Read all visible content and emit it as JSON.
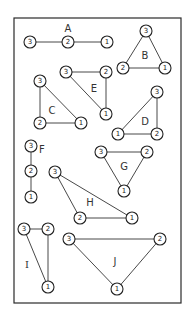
{
  "figure": {
    "frame": {
      "x": 14,
      "y": 18,
      "w": 167,
      "h": 285
    },
    "node_radius": 6,
    "graphs": [
      {
        "label": "A",
        "label_pos": [
          68,
          28
        ],
        "nodes": [
          {
            "id": "3",
            "x": 30,
            "y": 42
          },
          {
            "id": "2",
            "x": 68,
            "y": 42
          },
          {
            "id": "1",
            "x": 107,
            "y": 42
          }
        ],
        "edges": [
          [
            "3",
            "2"
          ],
          [
            "2",
            "1"
          ]
        ]
      },
      {
        "label": "B",
        "label_pos": [
          145,
          55
        ],
        "nodes": [
          {
            "id": "3",
            "x": 146,
            "y": 31
          },
          {
            "id": "2",
            "x": 123,
            "y": 68
          },
          {
            "id": "1",
            "x": 165,
            "y": 68
          }
        ],
        "edges": [
          [
            "3",
            "2"
          ],
          [
            "2",
            "1"
          ],
          [
            "3",
            "1"
          ]
        ]
      },
      {
        "label": "E",
        "label_pos": [
          94,
          88
        ],
        "nodes": [
          {
            "id": "3",
            "x": 66,
            "y": 72
          },
          {
            "id": "2",
            "x": 106,
            "y": 72
          },
          {
            "id": "1",
            "x": 106,
            "y": 114
          }
        ],
        "edges": [
          [
            "3",
            "2"
          ],
          [
            "2",
            "1"
          ],
          [
            "3",
            "1"
          ]
        ]
      },
      {
        "label": "C",
        "label_pos": [
          52,
          110
        ],
        "nodes": [
          {
            "id": "3",
            "x": 40,
            "y": 81
          },
          {
            "id": "2",
            "x": 40,
            "y": 123
          },
          {
            "id": "1",
            "x": 81,
            "y": 123
          }
        ],
        "edges": [
          [
            "3",
            "2"
          ],
          [
            "2",
            "1"
          ],
          [
            "3",
            "1"
          ]
        ]
      },
      {
        "label": "D",
        "label_pos": [
          145,
          121
        ],
        "nodes": [
          {
            "id": "3",
            "x": 157,
            "y": 92
          },
          {
            "id": "1",
            "x": 118,
            "y": 134
          },
          {
            "id": "2",
            "x": 157,
            "y": 134
          }
        ],
        "edges": [
          [
            "3",
            "2"
          ],
          [
            "1",
            "2"
          ],
          [
            "3",
            "1"
          ]
        ]
      },
      {
        "label": "F",
        "label_pos": [
          42,
          149
        ],
        "nodes": [
          {
            "id": "3",
            "x": 31,
            "y": 146
          },
          {
            "id": "2",
            "x": 31,
            "y": 171
          },
          {
            "id": "1",
            "x": 31,
            "y": 197
          }
        ],
        "edges": [
          [
            "3",
            "2"
          ],
          [
            "2",
            "1"
          ]
        ]
      },
      {
        "label": "G",
        "label_pos": [
          124,
          166
        ],
        "nodes": [
          {
            "id": "3",
            "x": 101,
            "y": 152
          },
          {
            "id": "2",
            "x": 147,
            "y": 152
          },
          {
            "id": "1",
            "x": 124,
            "y": 191
          }
        ],
        "edges": [
          [
            "3",
            "2"
          ],
          [
            "2",
            "1"
          ],
          [
            "3",
            "1"
          ]
        ]
      },
      {
        "label": "H",
        "label_pos": [
          90,
          202
        ],
        "nodes": [
          {
            "id": "3",
            "x": 55,
            "y": 172
          },
          {
            "id": "2",
            "x": 80,
            "y": 218
          },
          {
            "id": "1",
            "x": 132,
            "y": 218
          }
        ],
        "edges": [
          [
            "3",
            "2"
          ],
          [
            "2",
            "1"
          ],
          [
            "3",
            "1"
          ]
        ]
      },
      {
        "label": "I",
        "label_pos": [
          27,
          264
        ],
        "serif": true,
        "nodes": [
          {
            "id": "3",
            "x": 24,
            "y": 229
          },
          {
            "id": "2",
            "x": 48,
            "y": 229
          },
          {
            "id": "1",
            "x": 48,
            "y": 287
          }
        ],
        "edges": [
          [
            "3",
            "2"
          ],
          [
            "2",
            "1"
          ],
          [
            "3",
            "1"
          ]
        ]
      },
      {
        "label": "J",
        "label_pos": [
          115,
          261
        ],
        "nodes": [
          {
            "id": "3",
            "x": 69,
            "y": 239
          },
          {
            "id": "2",
            "x": 160,
            "y": 239
          },
          {
            "id": "1",
            "x": 117,
            "y": 289
          }
        ],
        "edges": [
          [
            "3",
            "2"
          ],
          [
            "2",
            "1"
          ],
          [
            "3",
            "1"
          ]
        ]
      }
    ]
  }
}
